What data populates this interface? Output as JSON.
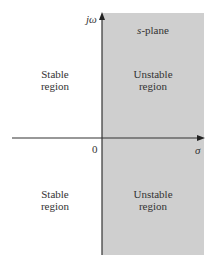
{
  "diagram": {
    "title": "s-plane",
    "axes": {
      "vertical_label": "jω",
      "horizontal_label": "σ",
      "origin_label": "0"
    },
    "regions": {
      "left_upper": [
        "Stable",
        "region"
      ],
      "left_lower": [
        "Stable",
        "region"
      ],
      "right_upper": [
        "Unstable",
        "region"
      ],
      "right_lower": [
        "Unstable",
        "region"
      ]
    },
    "colors": {
      "unstable_fill": "#cfcfcf",
      "axis": "#333333"
    }
  }
}
